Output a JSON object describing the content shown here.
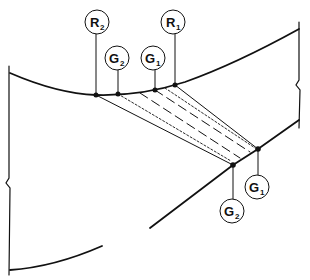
{
  "colors": {
    "line": "#111111",
    "background": "#ffffff"
  },
  "labels": {
    "top_R2": {
      "main": "R",
      "sub": "2"
    },
    "top_G2": {
      "main": "G",
      "sub": "2"
    },
    "top_G1": {
      "main": "G",
      "sub": "1"
    },
    "top_R1": {
      "main": "R",
      "sub": "1"
    },
    "bottom_G1": {
      "main": "G",
      "sub": "1"
    },
    "bottom_G2": {
      "main": "G",
      "sub": "2"
    }
  }
}
